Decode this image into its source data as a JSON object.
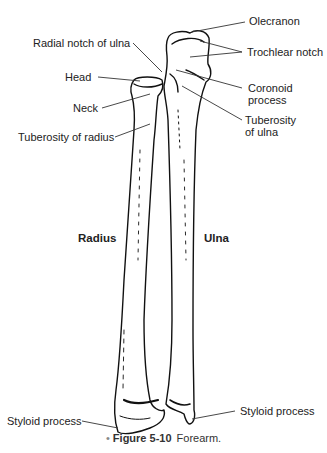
{
  "diagram": {
    "title_partial": "",
    "labels": {
      "olecranon": "Olecranon",
      "trochlear_notch": "Trochlear notch",
      "radial_notch": "Radial notch of ulna",
      "head": "Head",
      "neck": "Neck",
      "tuberosity_radius": "Tuberosity of radius",
      "coronoid_1": "Coronoid",
      "coronoid_2": "process",
      "tuberosity_ulna_1": "Tuberosity",
      "tuberosity_ulna_2": "of ulna",
      "radius": "Radius",
      "ulna": "Ulna",
      "styloid_left": "Styloid process",
      "styloid_right": "Styloid process"
    },
    "caption": {
      "bullet": "•",
      "figure_number": "Figure 5-10",
      "text": "Forearm."
    }
  }
}
